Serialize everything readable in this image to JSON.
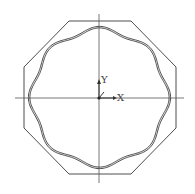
{
  "diagram": {
    "type": "cad-cross-section",
    "labels": {
      "y_axis": "Y",
      "x_axis": "X"
    },
    "colors": {
      "stroke": "#3a3a3a",
      "background": "#ffffff"
    },
    "shapes": {
      "outer": "octagon",
      "inner": "8-lobed wavy ring (double line)",
      "crosshair": "center lines"
    }
  }
}
